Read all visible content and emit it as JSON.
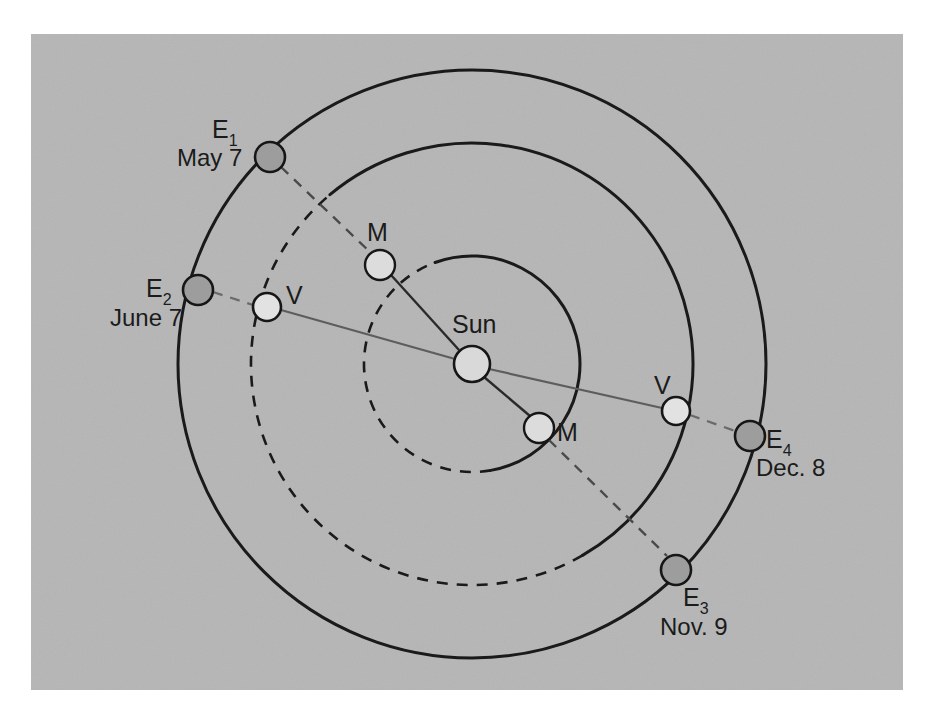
{
  "figure": {
    "panel_background_color": "#b6b6b6",
    "page_background_color": "#ffffff",
    "stroke_color": "#1a1a1a"
  },
  "panel": {
    "x": 31,
    "y": 34,
    "width": 872,
    "height": 656
  },
  "sun": {
    "label": "Sun",
    "cx": 472,
    "cy": 364,
    "r": 18,
    "fill": "#d9d9d9"
  },
  "orbits": [
    {
      "name": "mercury-orbit",
      "planet": "Mercury",
      "r": 108,
      "solid_sweep_deg": [
        -110,
        80
      ],
      "style": "half-solid-half-dashed"
    },
    {
      "name": "venus-orbit",
      "planet": "Venus",
      "r": 221,
      "solid_sweep_deg": [
        -130,
        60
      ],
      "style": "half-solid-half-dashed"
    },
    {
      "name": "earth-orbit",
      "planet": "Earth",
      "r": 294,
      "solid_sweep_deg": [
        -180,
        180
      ],
      "style": "solid"
    }
  ],
  "earth_positions": [
    {
      "id": "E1",
      "label": "E",
      "subscript": "1",
      "date": "May 7",
      "cx": 270,
      "cy": 157,
      "r": 15,
      "label_x": 218,
      "label_y": 134,
      "date_x": 183,
      "date_y": 162
    },
    {
      "id": "E2",
      "label": "E",
      "subscript": "2",
      "date": "June 7",
      "cx": 198,
      "cy": 290,
      "r": 15,
      "label_x": 150,
      "label_y": 293,
      "date_x": 112,
      "date_y": 322
    },
    {
      "id": "E3",
      "label": "E",
      "subscript": "3",
      "date": "Nov. 9",
      "cx": 676,
      "cy": 570,
      "r": 15,
      "label_x": 686,
      "label_y": 606,
      "date_x": 663,
      "date_y": 634
    },
    {
      "id": "E4",
      "label": "E",
      "subscript": "4",
      "date": "Dec. 8",
      "cx": 750,
      "cy": 436,
      "r": 15,
      "label_x": 764,
      "label_y": 447,
      "date_x": 757,
      "date_y": 474
    }
  ],
  "venus_positions": [
    {
      "id": "V-left",
      "label": "V",
      "cx": 267,
      "cy": 307,
      "r": 14,
      "label_x": 286,
      "label_y": 304
    },
    {
      "id": "V-right",
      "label": "V",
      "cx": 676,
      "cy": 411,
      "r": 14,
      "label_x": 654,
      "label_y": 394
    }
  ],
  "mercury_positions": [
    {
      "id": "M-upper",
      "label": "M",
      "cx": 380,
      "cy": 265,
      "r": 15,
      "label_x": 367,
      "label_y": 241
    },
    {
      "id": "M-lower",
      "label": "M",
      "cx": 539,
      "cy": 428,
      "r": 15,
      "label_x": 557,
      "label_y": 441
    }
  ],
  "sight_lines": [
    {
      "name": "venus-transit-line",
      "from": "E2",
      "through": [
        "V-left",
        "Sun",
        "V-right"
      ],
      "to": "E4",
      "style": "solid-center-dashed-ends"
    },
    {
      "name": "mercury-transit-line",
      "from": "E1",
      "through": [
        "M-upper",
        "Sun",
        "M-lower"
      ],
      "to": "E3",
      "style": "solid-center-dashed-ends"
    }
  ],
  "labels": {
    "sun": "Sun",
    "mercury": "M",
    "venus": "V",
    "earth": "E"
  }
}
